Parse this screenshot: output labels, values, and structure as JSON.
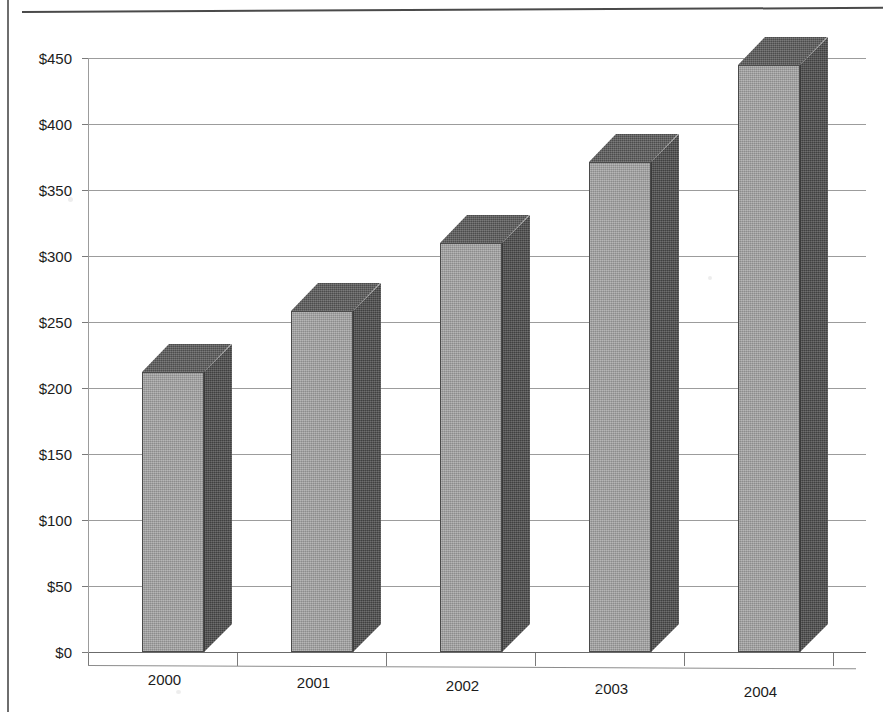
{
  "document": {
    "title_partial": "",
    "page_background": "#ffffff",
    "frame_line_color": "#4a4a4a"
  },
  "chart_data": {
    "type": "bar",
    "title": "",
    "subtitle": "",
    "xlabel": "",
    "ylabel": "",
    "categories": [
      "2000",
      "2001",
      "2002",
      "2003",
      "2004"
    ],
    "values": [
      212,
      258,
      310,
      371,
      445
    ],
    "value_prefix": "$",
    "ylim": [
      0,
      450
    ],
    "ytick_step": 50,
    "ytick_labels": [
      "$450",
      "$400",
      "$350",
      "$300",
      "$250",
      "$200",
      "$150",
      "$100",
      "$50",
      "$0"
    ],
    "ytick_values": [
      450,
      400,
      350,
      300,
      250,
      200,
      150,
      100,
      50,
      0
    ],
    "grid": true,
    "grid_axis": "y",
    "legend": false,
    "legend_position": "none",
    "style": "3d-column",
    "series": [
      {
        "name": "Revenue",
        "values": [
          212,
          258,
          310,
          371,
          445
        ],
        "front_color": "#9b9b9b",
        "side_color": "#4f4f4f",
        "top_color": "#5c5c5c"
      }
    ]
  },
  "axes": {
    "y": {
      "ticks": [
        {
          "label": "$450",
          "value": 450
        },
        {
          "label": "$400",
          "value": 400
        },
        {
          "label": "$350",
          "value": 350
        },
        {
          "label": "$300",
          "value": 300
        },
        {
          "label": "$250",
          "value": 250
        },
        {
          "label": "$200",
          "value": 200
        },
        {
          "label": "$150",
          "value": 150
        },
        {
          "label": "$100",
          "value": 100
        },
        {
          "label": "$50",
          "value": 50
        },
        {
          "label": "$0",
          "value": 0
        }
      ]
    },
    "x": {
      "ticks": [
        {
          "label": "2000"
        },
        {
          "label": "2001"
        },
        {
          "label": "2002"
        },
        {
          "label": "2003"
        },
        {
          "label": "2004"
        }
      ]
    }
  }
}
